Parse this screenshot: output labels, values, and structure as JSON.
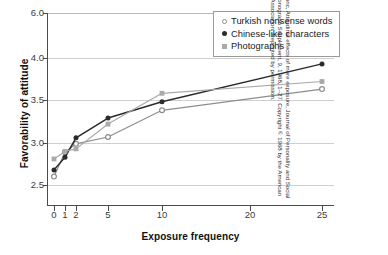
{
  "chart_data": {
    "type": "line",
    "title": "",
    "xlabel": "Exposure frequency",
    "ylabel": "Favorability of attitude",
    "x": [
      0,
      1,
      2,
      5,
      10,
      25
    ],
    "xticks": [
      "0",
      "1",
      "2",
      "5",
      "10",
      "20",
      "25"
    ],
    "xtick_values": [
      0,
      1,
      2,
      5,
      10,
      20,
      25
    ],
    "yticks": [
      "2.5",
      "3.0",
      "3.5",
      "4.0",
      "6.0"
    ],
    "ytick_values": [
      2.5,
      3.0,
      3.5,
      4.0,
      6.0
    ],
    "ylim": [
      2.35,
      6.0
    ],
    "grid": true,
    "axis_note": "non-linear (compressed) x and y scales",
    "legend_position": "top-right",
    "series": [
      {
        "name": "Turkish nonsense words",
        "marker": "open-circle",
        "color": "#8d8d8d",
        "values": [
          2.6,
          2.89,
          2.99,
          3.07,
          3.38,
          3.63
        ]
      },
      {
        "name": "Chinese-like characters",
        "marker": "filled-circle",
        "color": "#2b2b2b",
        "values": [
          2.68,
          2.83,
          3.06,
          3.29,
          3.48,
          3.93
        ]
      },
      {
        "name": "Photographs",
        "marker": "square",
        "color": "#a9a9a9",
        "values": [
          2.81,
          2.9,
          2.93,
          3.22,
          3.58,
          3.72
        ]
      }
    ]
  },
  "legend": {
    "items": [
      {
        "label": "Turkish nonsense words",
        "marker": "open-circle"
      },
      {
        "label": "Chinese-like characters",
        "marker": "filled-circle"
      },
      {
        "label": "Photographs",
        "marker": "square"
      }
    ]
  },
  "source": {
    "text": "From R.S. Zajonc, Attitudinal effects of mere exposure, Journal of Personality and Social Psychology, Monograph Supplement, 9, 1968, 1–27. Copyright © 1968 by the American Psychological Association. Reprinted by permission."
  },
  "colors": {
    "axis": "#4a4a4a",
    "grid": "#cfcfcf",
    "series_turkish": "#8d8d8d",
    "series_chinese": "#2b2b2b",
    "series_photographs": "#a9a9a9",
    "background": "#ffffff"
  }
}
